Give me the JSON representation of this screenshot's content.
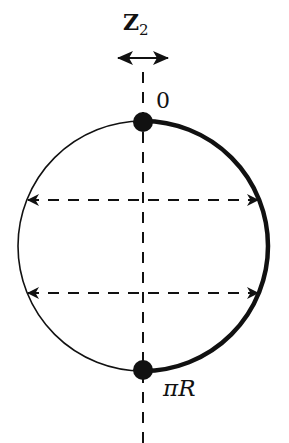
{
  "diagram": {
    "type": "orbifold-circle",
    "symmetry_label": {
      "main": "Z",
      "subscript": "2"
    },
    "points": [
      {
        "id": "top",
        "label": "0"
      },
      {
        "id": "bottom",
        "label_prefix": "π",
        "label_suffix": "R"
      }
    ],
    "circle": {
      "cx": 143,
      "cy": 246,
      "r": 125
    },
    "highlighted_arc": "right half (0 to πR)",
    "reflection_lines": 2,
    "colors": {
      "stroke": "#111111",
      "background": "#ffffff"
    }
  }
}
